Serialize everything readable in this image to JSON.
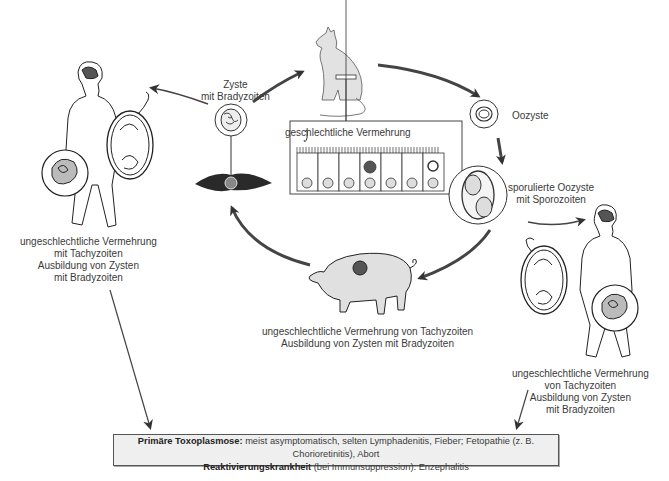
{
  "labels": {
    "cyst": [
      "Zyste",
      "mit Bradyzoiten"
    ],
    "oocyst": "Oozyste",
    "sporulated": [
      "sporulierte Oozyste",
      "mit Sporozoiten"
    ],
    "cat_inset": "geschlechtliche Vermehrung",
    "human_left": [
      "ungeschlechtliche Vermehrung",
      "mit Tachyzoiten",
      "Ausbildung von Zysten",
      "mit Bradyzoiten"
    ],
    "pig": [
      "ungeschlechtliche Vermehrung von Tachyzoiten",
      "Ausbildung von Zysten mit Bradyzoiten"
    ],
    "human_right": [
      "ungeschlechtliche Vermehrung",
      "von Tachyzoiten",
      "Ausbildung von Zysten",
      "mit Bradyzoiten"
    ]
  },
  "summary": {
    "line1_bold": "Primäre Toxoplasmose:",
    "line1_text": " meist asymptomatisch, selten Lymphadenitis, Fieber; Fetopathie (z. B. Chorioretinitis), Abort",
    "line2_bold": "Reaktivierungskrankheit",
    "line2_text": " (bei Immunsuppression): Enzephalitis"
  },
  "nodes": [
    "cat-icon",
    "oocyst-icon",
    "sporulated-oocyst-icon",
    "pig-icon",
    "muscle-cell-icon",
    "tissue-cyst-icon",
    "human-left-icon",
    "human-right-icon",
    "intestinal-epithelium-icon"
  ]
}
